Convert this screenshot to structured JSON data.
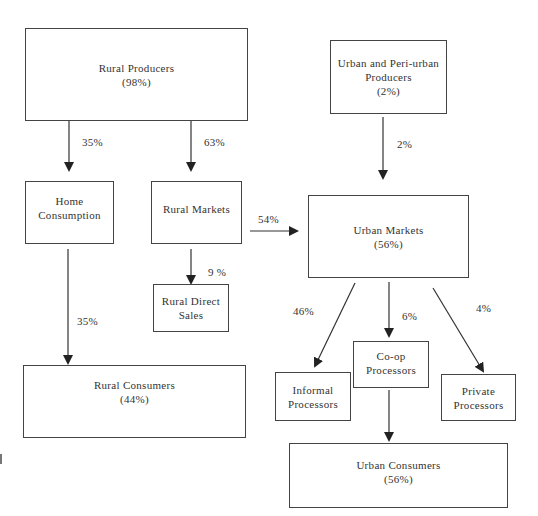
{
  "diagram": {
    "nodes": {
      "rural_producers": {
        "name": "Rural Producers",
        "share": "(98%)"
      },
      "urban_producers": {
        "name_line1": "Urban and Peri-urban",
        "name_line2": "Producers",
        "share": "(2%)"
      },
      "home_consumption": {
        "name_line1": "Home",
        "name_line2": "Consumption"
      },
      "rural_markets": {
        "name": "Rural Markets"
      },
      "rural_direct_sales": {
        "name_line1": "Rural Direct",
        "name_line2": "Sales"
      },
      "urban_markets": {
        "name": "Urban Markets",
        "share": "(56%)"
      },
      "rural_consumers": {
        "name": "Rural Consumers",
        "share": "(44%)"
      },
      "informal_processors": {
        "name_line1": "Informal",
        "name_line2": "Processors"
      },
      "coop_processors": {
        "name_line1": "Co-op",
        "name_line2": "Processors"
      },
      "private_processors": {
        "name_line1": "Private",
        "name_line2": "Processors"
      },
      "urban_consumers": {
        "name": "Urban Consumers",
        "share": "(56%)"
      }
    },
    "edges": {
      "rural_producers_to_home": "35%",
      "rural_producers_to_rural_markets": "63%",
      "urban_producers_to_urban_markets": "2%",
      "rural_markets_to_urban_markets": "54%",
      "rural_markets_to_direct_sales": "9 %",
      "home_to_rural_consumers": "35%",
      "urban_markets_to_informal": "46%",
      "urban_markets_to_coop": "6%",
      "urban_markets_to_private": "4%"
    },
    "colors": {
      "line": "#333333",
      "border": "#444444",
      "background": "#ffffff"
    }
  }
}
